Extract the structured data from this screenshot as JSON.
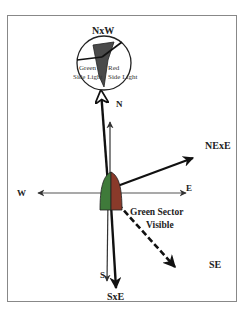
{
  "colors": {
    "frame": "#888888",
    "green_side": "#3f7a3a",
    "red_side": "#8a3a2a",
    "boat_dark": "#4a4a4a",
    "line": "#222222",
    "thin_line": "#555555"
  },
  "labels": {
    "nxw": "NxW",
    "n": "N",
    "nexe": "NExE",
    "w": "W",
    "e": "E",
    "se": "SE",
    "s": "S",
    "sxe": "SxE",
    "green_sector_line1": "Green Sector",
    "green_sector_line2": "Visible",
    "green_side_light_line1": "Green",
    "green_side_light_line2": "Side Light",
    "red_side_light_line1": "Red",
    "red_side_light_line2": "Side Light"
  }
}
